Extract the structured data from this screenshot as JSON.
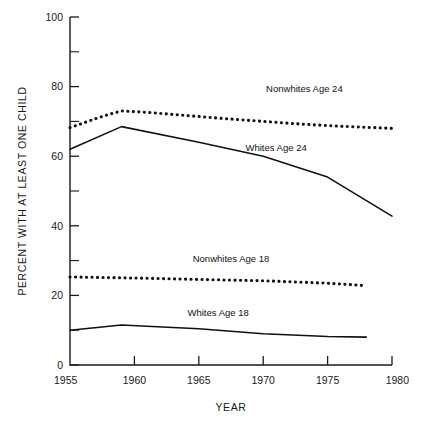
{
  "chart_data": {
    "type": "line",
    "title": "",
    "xlabel": "YEAR",
    "ylabel": "PERCENT WITH AT LEAST ONE CHILD",
    "xlim": [
      1955,
      1980
    ],
    "ylim": [
      0,
      100
    ],
    "grid": false,
    "legend_position": "inline-annotations",
    "xticks": [
      1955,
      1960,
      1965,
      1970,
      1975,
      1980
    ],
    "xtick_labels": [
      "1955",
      "1960",
      "1965",
      "1970",
      "1975",
      "1980"
    ],
    "yticks": [
      0,
      20,
      40,
      60,
      80,
      100
    ],
    "ytick_labels": [
      "0",
      "20",
      "40",
      "60",
      "80",
      "100"
    ],
    "yticks_minor": [
      10,
      30,
      50,
      70,
      90
    ],
    "series": [
      {
        "name": "Nonwhites Age 24",
        "style": "dotted",
        "x": [
          1955,
          1956,
          1957,
          1958,
          1959,
          1961,
          1963,
          1965,
          1967,
          1970,
          1973,
          1976,
          1978,
          1980
        ],
        "values": [
          68.2,
          69.5,
          70.8,
          72.0,
          73.0,
          72.6,
          72.0,
          71.4,
          70.8,
          70.0,
          69.2,
          68.6,
          68.3,
          68.0
        ]
      },
      {
        "name": "Whites Age 24",
        "style": "solid",
        "x": [
          1955,
          1959,
          1965,
          1970,
          1975,
          1980
        ],
        "values": [
          62.0,
          68.5,
          64.0,
          60.0,
          54.0,
          42.8
        ]
      },
      {
        "name": "Nonwhites Age 18",
        "style": "dotted",
        "x": [
          1955,
          1960,
          1965,
          1970,
          1975,
          1978
        ],
        "values": [
          25.3,
          25.0,
          24.6,
          24.2,
          23.5,
          22.8
        ]
      },
      {
        "name": "Whites Age 18",
        "style": "solid",
        "x": [
          1955,
          1959,
          1965,
          1970,
          1975,
          1978
        ],
        "values": [
          10.0,
          11.5,
          10.4,
          9.0,
          8.2,
          8.0
        ]
      }
    ],
    "annotations": [
      {
        "text": "Nonwhites Age 24",
        "x": 1973.2,
        "y": 78.5,
        "anchor": "middle"
      },
      {
        "text": "Whites Age 24",
        "x": 1971.0,
        "y": 61.5,
        "anchor": "middle"
      },
      {
        "text": "Nonwhites Age 18",
        "x": 1967.5,
        "y": 29.5,
        "anchor": "middle"
      },
      {
        "text": "Whites Age 18",
        "x": 1966.5,
        "y": 14.0,
        "anchor": "middle"
      }
    ]
  },
  "colors": {
    "ink": "#111111",
    "axis": "#1a1a1a",
    "background": "#ffffff"
  }
}
